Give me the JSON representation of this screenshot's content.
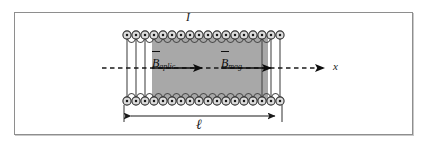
{
  "figure": {
    "type": "physics-diagram",
    "frame": {
      "border_color": "#8e8e8e",
      "background_color": "#ffffff"
    }
  },
  "labels": {
    "current": "I",
    "axis_x": "x",
    "length": "ℓ",
    "b_applied": {
      "symbol": "B",
      "subscript": "aplic"
    },
    "b_magnetization": {
      "symbol": "B",
      "subscript": "mag"
    }
  },
  "colors": {
    "core_fill": "#a8a8a8",
    "coil_stroke": "#3a3a3a",
    "coil_fill": "#d8d8d8",
    "arrow": "#0d0d0d",
    "frame": "#8e8e8e",
    "axis_dash": "#1a1a1a"
  },
  "geometry": {
    "core": {
      "x": 152,
      "y": 35,
      "width": 116,
      "height": 66
    },
    "coil_turns": 17,
    "coil_top_y": 35,
    "coil_bottom_y": 101,
    "axis_y": 68,
    "axis_start_x": 102,
    "axis_end_x": 328,
    "dimension_line_y": 116,
    "dimension_left_x": 124,
    "dimension_right_x": 282
  },
  "vectors": [
    {
      "name": "B_aplic",
      "x1": 152,
      "x2": 205,
      "y": 68
    },
    {
      "name": "B_mag",
      "x1": 221,
      "x2": 274,
      "y": 68
    }
  ]
}
